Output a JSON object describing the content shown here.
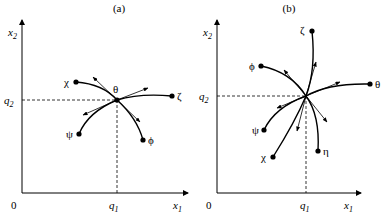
{
  "panels": [
    {
      "id": "a",
      "caption": "(a)",
      "origin_label": "0",
      "x_axis_label": "x",
      "x_axis_sub": "1",
      "y_axis_label": "x",
      "y_axis_sub": "2",
      "q1_label": "q",
      "q1_sub": "1",
      "q2_label": "q",
      "q2_sub": "2",
      "center_label": "θ",
      "points": [
        {
          "name": "χ"
        },
        {
          "name": "ζ"
        },
        {
          "name": "ψ"
        },
        {
          "name": "ϕ"
        }
      ]
    },
    {
      "id": "b",
      "caption": "(b)",
      "origin_label": "0",
      "x_axis_label": "x",
      "x_axis_sub": "1",
      "y_axis_label": "x",
      "y_axis_sub": "2",
      "q1_label": "q",
      "q1_sub": "1",
      "q2_label": "q",
      "q2_sub": "2",
      "points": [
        {
          "name": "ζ"
        },
        {
          "name": "ϕ"
        },
        {
          "name": "θ"
        },
        {
          "name": "ψ"
        },
        {
          "name": "χ"
        },
        {
          "name": "η"
        }
      ]
    }
  ]
}
